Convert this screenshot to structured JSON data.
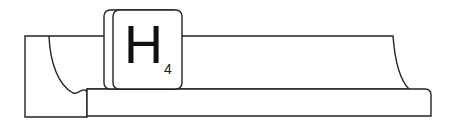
{
  "diagram": {
    "tile": {
      "letter": "H",
      "score": "4"
    },
    "colors": {
      "stroke": "#222222",
      "fill": "#ffffff"
    }
  }
}
